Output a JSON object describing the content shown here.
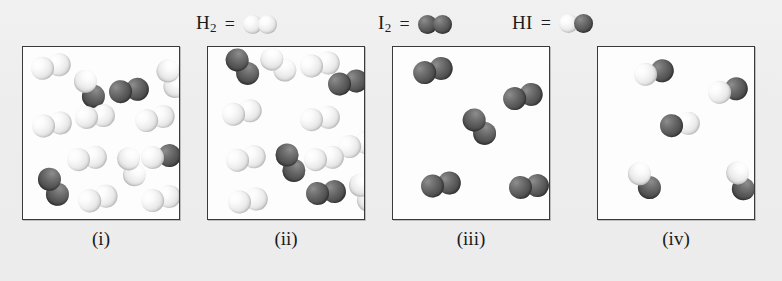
{
  "figure": {
    "title": "",
    "background_color": "#eeeeee",
    "panel_background": "#fdfdfd",
    "panel_border_color": "#3a3a3a"
  },
  "legend": {
    "entries": [
      {
        "id": "h2",
        "label_main": "H",
        "label_sub": "2",
        "equals": "=",
        "molecule": "H2",
        "atoms": [
          "light",
          "light"
        ]
      },
      {
        "id": "i2",
        "label_main": "I",
        "label_sub": "2",
        "equals": "=",
        "molecule": "I2",
        "atoms": [
          "dark",
          "dark"
        ]
      },
      {
        "id": "hi",
        "label_main": "HI",
        "label_sub": "",
        "equals": "=",
        "molecule": "HI",
        "atoms": [
          "light",
          "dark"
        ]
      }
    ]
  },
  "colors": {
    "hydrogen_atom": "#ededed",
    "iodine_atom": "#5c5c5c",
    "text": "#1a1a1a"
  },
  "chart_data": {
    "type": "diagram",
    "subtitle": "Space-filling models of reaction mixtures at four compositions",
    "legend_entries": [
      "H2 = two light spheres",
      "I2 = two dark spheres",
      "HI = one light and one dark sphere"
    ],
    "panels": [
      {
        "id": "i",
        "caption": "(i)",
        "counts": {
          "H2": 11,
          "I2": 2,
          "HI": 2
        },
        "molecules": [
          {
            "type": "H2",
            "x": 8,
            "y": 8,
            "rot": -12
          },
          {
            "type": "HI",
            "x": 46,
            "y": 30,
            "rot": 62
          },
          {
            "type": "I2",
            "x": 86,
            "y": 32,
            "rot": -8
          },
          {
            "type": "H2",
            "x": 128,
            "y": 20,
            "rot": 66
          },
          {
            "type": "H2",
            "x": 9,
            "y": 66,
            "rot": -10
          },
          {
            "type": "H2",
            "x": 52,
            "y": 58,
            "rot": -6
          },
          {
            "type": "H2",
            "x": 112,
            "y": 60,
            "rot": -14
          },
          {
            "type": "H2",
            "x": 44,
            "y": 100,
            "rot": -8
          },
          {
            "type": "H2",
            "x": 88,
            "y": 108,
            "rot": 70
          },
          {
            "type": "HI",
            "x": 118,
            "y": 98,
            "rot": -6
          },
          {
            "type": "I2",
            "x": 10,
            "y": 128,
            "rot": 62
          },
          {
            "type": "H2",
            "x": 55,
            "y": 140,
            "rot": -16
          },
          {
            "type": "H2",
            "x": 118,
            "y": 140,
            "rot": -14
          }
        ]
      },
      {
        "id": "ii",
        "caption": "(ii)",
        "counts": {
          "H2": 10,
          "I2": 4,
          "HI": 0
        },
        "molecules": [
          {
            "type": "I2",
            "x": 14,
            "y": 8,
            "rot": 52
          },
          {
            "type": "H2",
            "x": 50,
            "y": 6,
            "rot": 40
          },
          {
            "type": "H2",
            "x": 92,
            "y": 6,
            "rot": -10
          },
          {
            "type": "I2",
            "x": 120,
            "y": 24,
            "rot": -10
          },
          {
            "type": "H2",
            "x": 14,
            "y": 54,
            "rot": -12
          },
          {
            "type": "H2",
            "x": 92,
            "y": 60,
            "rot": -8
          },
          {
            "type": "H2",
            "x": 130,
            "y": 86,
            "rot": -14
          },
          {
            "type": "H2",
            "x": 18,
            "y": 100,
            "rot": -12
          },
          {
            "type": "I2",
            "x": 62,
            "y": 104,
            "rot": 66
          },
          {
            "type": "H2",
            "x": 96,
            "y": 100,
            "rot": -8
          },
          {
            "type": "I2",
            "x": 98,
            "y": 134,
            "rot": -6
          },
          {
            "type": "H2",
            "x": 20,
            "y": 142,
            "rot": -10
          },
          {
            "type": "H2",
            "x": 136,
            "y": 134,
            "rot": 62
          }
        ]
      },
      {
        "id": "iii",
        "caption": "(iii)",
        "counts": {
          "H2": 0,
          "I2": 5,
          "HI": 0
        },
        "molecules": [
          {
            "type": "I2",
            "x": 20,
            "y": 12,
            "rot": -14
          },
          {
            "type": "I2",
            "x": 110,
            "y": 38,
            "rot": -14
          },
          {
            "type": "I2",
            "x": 66,
            "y": 68,
            "rot": 52
          },
          {
            "type": "I2",
            "x": 28,
            "y": 126,
            "rot": -10
          },
          {
            "type": "I2",
            "x": 116,
            "y": 128,
            "rot": -6
          }
        ]
      },
      {
        "id": "iv",
        "caption": "(iv)",
        "counts": {
          "H2": 0,
          "I2": 0,
          "HI": 5
        },
        "molecules": [
          {
            "type": "HI",
            "x": 36,
            "y": 14,
            "rot": -12
          },
          {
            "type": "HI",
            "x": 110,
            "y": 32,
            "rot": -12
          },
          {
            "type": "HI",
            "x": 62,
            "y": 66,
            "rot": -8,
            "flip": true
          },
          {
            "type": "HI",
            "x": 26,
            "y": 122,
            "rot": 54
          },
          {
            "type": "HI",
            "x": 122,
            "y": 122,
            "rot": 70
          }
        ]
      }
    ]
  }
}
